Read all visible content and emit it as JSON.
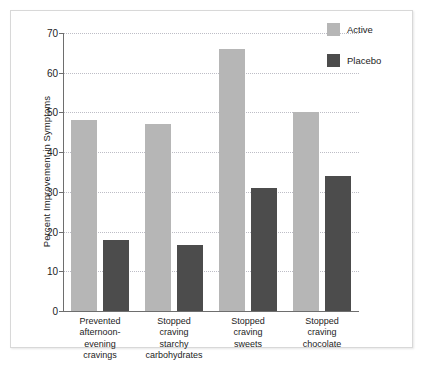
{
  "chart_data": {
    "type": "bar",
    "title": "",
    "xlabel": "",
    "ylabel": "Percent Improvement in Symptoms",
    "ylim": [
      0,
      70
    ],
    "yticks": [
      0,
      10,
      20,
      30,
      40,
      50,
      60,
      70
    ],
    "ytick_labels": [
      "0",
      "10",
      "20",
      "30",
      "40",
      "50",
      "60",
      "70"
    ],
    "grid": true,
    "legend_position": "right",
    "categories": [
      "Prevented\nafternoon-\nevening\ncravings",
      "Stopped\ncraving\nstarchy\ncarbohydrates",
      "Stopped\ncraving\nsweets",
      "Stopped\ncraving\nchocolate"
    ],
    "series": [
      {
        "name": "Active",
        "color": "#b6b6b6",
        "values": [
          48,
          47,
          66,
          50
        ]
      },
      {
        "name": "Placebo",
        "color": "#4c4c4c",
        "values": [
          18,
          16.5,
          31,
          34
        ]
      }
    ]
  },
  "legend": {
    "items": [
      {
        "label": "Active",
        "color": "#b6b6b6"
      },
      {
        "label": "Placebo",
        "color": "#4c4c4c"
      }
    ]
  }
}
